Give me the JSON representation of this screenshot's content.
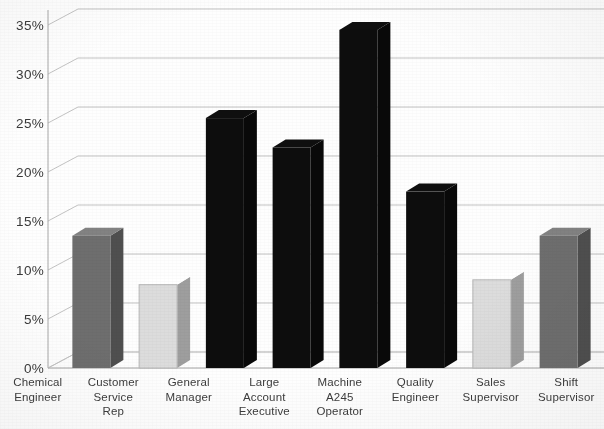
{
  "chart_data": {
    "type": "bar",
    "title": "",
    "subtitle": "",
    "xlabel": "",
    "ylabel": "",
    "categories": [
      "Chemical Engineer",
      "Customer Service Rep",
      "General Manager",
      "Large Account Executive",
      "Machine A245 Operator",
      "Quality Engineer",
      "Sales Supervisor",
      "Shift Supervisor"
    ],
    "category_lines": [
      [
        "Chemical",
        "Engineer"
      ],
      [
        "Customer",
        "Service",
        "Rep"
      ],
      [
        "General",
        "Manager"
      ],
      [
        "Large",
        "Account",
        "Executive"
      ],
      [
        "Machine",
        "A245",
        "Operator"
      ],
      [
        "Quality",
        "Engineer"
      ],
      [
        "Sales",
        "Supervisor"
      ],
      [
        "Shift",
        "Supervisor"
      ]
    ],
    "values": [
      13.5,
      8.5,
      25.5,
      22.5,
      34.5,
      18.0,
      9.0,
      13.5
    ],
    "bar_colors": [
      "#6e6e6e",
      "#dcdcdc",
      "#0d0d0d",
      "#0d0d0d",
      "#0d0d0d",
      "#0d0d0d",
      "#dcdcdc",
      "#6e6e6e"
    ],
    "ylim": [
      0,
      35
    ],
    "ytick_values": [
      0,
      5,
      10,
      15,
      20,
      25,
      30,
      35
    ],
    "ytick_labels": [
      "0%",
      "5%",
      "10%",
      "15%",
      "20%",
      "25%",
      "30%",
      "35%"
    ],
    "grid": true,
    "legend": null,
    "style": "3d-column",
    "series": [
      {
        "name": "",
        "values": [
          13.5,
          8.5,
          25.5,
          22.5,
          34.5,
          18.0,
          9.0,
          13.5
        ]
      }
    ]
  },
  "axes": {
    "y_axis_name": "percent-axis",
    "x_axis_name": "job-title-axis"
  }
}
